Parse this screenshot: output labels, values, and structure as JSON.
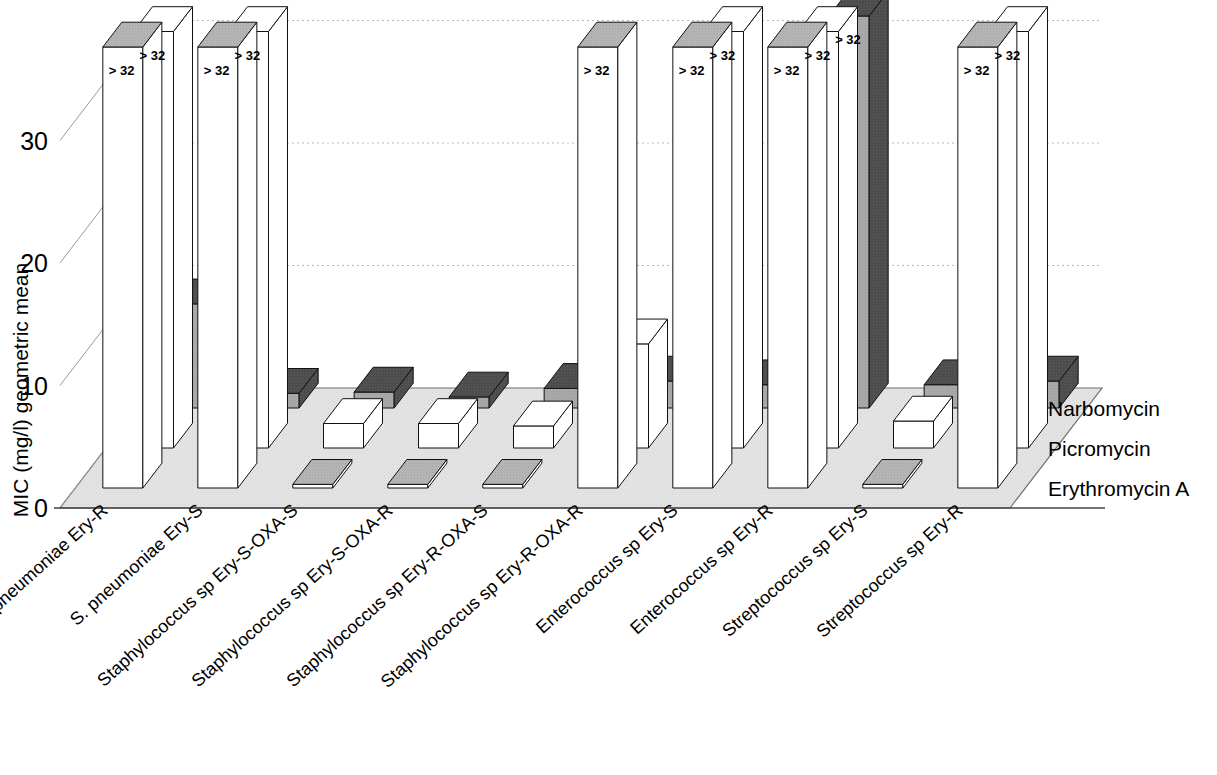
{
  "chart_data": {
    "type": "bar",
    "title": "",
    "subtitle": "",
    "xlabel": "",
    "ylabel": "MIC (mg/l) geometric mean",
    "ylim": [
      0,
      40
    ],
    "yticks": [
      0,
      10,
      20,
      30
    ],
    "ytick_labels": [
      "0",
      "10",
      "20",
      "30"
    ],
    "grid": true,
    "legend_position": "right",
    "projection": "3d",
    "value_label_text": ">32",
    "value_label_display": "> 32",
    "categories": [
      "S. pneumoniae Ery-R",
      "S. pneumoniae Ery-S",
      "Staphylococcus sp Ery-S-OXA-S",
      "Staphylococcus sp Ery-S-OXA-R",
      "Staphylococcus sp Ery-R-OXA-S",
      "Staphylococcus sp Ery-R-OXA-R",
      "Enterococcus sp Ery-S",
      "Enterococcus sp Ery-R",
      "Streptococcus sp Ery-S",
      "Streptococcus sp Ery-R"
    ],
    "series": [
      {
        "name": "Erythromycin A",
        "color": "#4d4d4d",
        "side_color": "#a8a8a8",
        "top_color": "#4d4d4d",
        "values": [
          36,
          36,
          0.3,
          0.3,
          0.3,
          36,
          36,
          36,
          0.3,
          36
        ],
        "labels": [
          "> 32",
          "> 32",
          "",
          "",
          "",
          "> 32",
          "> 32",
          "> 32",
          "",
          "> 32"
        ]
      },
      {
        "name": "Picromycin",
        "color": "#ffffff",
        "side_color": "#ffffff",
        "top_color": "#ffffff",
        "values": [
          34,
          34,
          2.0,
          2.0,
          1.8,
          8.5,
          34,
          34,
          2.2,
          34
        ],
        "labels": [
          "> 32",
          "> 32",
          "",
          "",
          "",
          "",
          "> 32",
          "> 32",
          "",
          "> 32"
        ]
      },
      {
        "name": "Narbomycin",
        "color": "#ffffff",
        "side_color": "#ffffff",
        "top_color": "#b4b4b4",
        "values": [
          8.5,
          1.2,
          1.3,
          0.9,
          1.6,
          2.2,
          1.9,
          32,
          1.9,
          2.2
        ],
        "labels": [
          "",
          "",
          "",
          "",
          "",
          "",
          "",
          "> 32",
          "",
          ""
        ]
      }
    ]
  },
  "legend": {
    "items": [
      {
        "label": "Erythromycin A"
      },
      {
        "label": "Picromycin"
      },
      {
        "label": "Narbomycin"
      }
    ]
  },
  "axes": {
    "y_title": "MIC (mg/l) geometric mean",
    "y_tick_0": "0",
    "y_tick_10": "10",
    "y_tick_20": "20",
    "y_tick_30": "30"
  },
  "colors": {
    "floor": "#e3e3e3",
    "dark_bar": "#4d4d4d",
    "dark_bar_side": "#a8a8a8",
    "gray_top": "#b4b4b4",
    "white_bar": "#ffffff",
    "outline": "#000000",
    "gridline": "#bbbbbb"
  }
}
